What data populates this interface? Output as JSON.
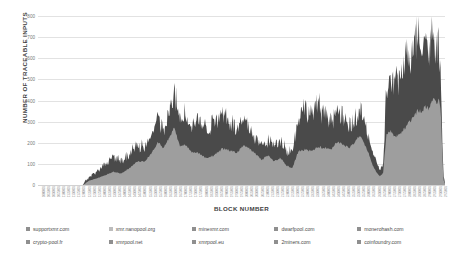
{
  "chart_data": {
    "type": "area",
    "stacked": true,
    "title": "",
    "xlabel": "BLOCK NUMBER",
    "ylabel": "NUMBER OF TRACEABLE INPUTS",
    "ylim": [
      0,
      800
    ],
    "yticks": [
      0,
      100,
      200,
      300,
      400,
      500,
      600,
      700,
      800
    ],
    "grid": true,
    "legend_position": "bottom",
    "legend_columns": 5,
    "x_tick_rotation": -90,
    "x": [
      1000001,
      1025001,
      1050001,
      1075001,
      1100001,
      1125001,
      1150001,
      1175001,
      1200001,
      1225001,
      1250001,
      1275001,
      1300001,
      1325001,
      1350001,
      1375001,
      1400001,
      1425001,
      1450001,
      1475001,
      1500001,
      1525001,
      1550001,
      1575001,
      1600001,
      1625001,
      1650001,
      1675001,
      1700001,
      1725001,
      1750001,
      1775001,
      1800001,
      1825001,
      1850001,
      1875001,
      1900001,
      1925001,
      1950001,
      1975001,
      2000001,
      2025001,
      2050001,
      2075001,
      2100001,
      2125001,
      2150001,
      2175001,
      2200001,
      2225001,
      2250001,
      2275001,
      2300001,
      2325001,
      2350001,
      2375001,
      2400001,
      2425001,
      2450001,
      2475001,
      2500001,
      2525001,
      2550001,
      2575001,
      2600001,
      2625001,
      2650001,
      2675001,
      2700001,
      2725001,
      2750001,
      2775001,
      2800001,
      2825001,
      2850001,
      2875001,
      2900001,
      2925001,
      2950001,
      2975001
    ],
    "series": [
      {
        "name": "supportxmr.com",
        "color": "#9a9a9a"
      },
      {
        "name": "xmr.nanopool.org",
        "color": "#c9c9c9"
      },
      {
        "name": "minexmr.com",
        "color": "#8f8f8f"
      },
      {
        "name": "dwarfpool.com",
        "color": "#a5a5a5"
      },
      {
        "name": "monerohash.com",
        "color": "#7b7b7b"
      },
      {
        "name": "crypto-pool.fr",
        "color": "#b4b4b4"
      },
      {
        "name": "xmrpool.net",
        "color": "#8a8a8a"
      },
      {
        "name": "xmrpool.eu",
        "color": "#9f9f9f"
      },
      {
        "name": "2miners.com",
        "color": "#707070"
      },
      {
        "name": "coinfoundry.com",
        "color": "#5f5f5f"
      }
    ]
  },
  "legend": {
    "items": [
      {
        "label": "supportxmr.com",
        "color": "#8f8f8f"
      },
      {
        "label": "xmr.nanopool.org",
        "color": "#bdbdbd"
      },
      {
        "label": "minexmr.com",
        "color": "#8f8f8f"
      },
      {
        "label": "dwarfpool.com",
        "color": "#8f8f8f"
      },
      {
        "label": "monerohash.com",
        "color": "#8f8f8f"
      },
      {
        "label": "crypto-pool.fr",
        "color": "#8f8f8f"
      },
      {
        "label": "xmrpool.net",
        "color": "#8f8f8f"
      },
      {
        "label": "xmrpool.eu",
        "color": "#8f8f8f"
      },
      {
        "label": "2miners.com",
        "color": "#8f8f8f"
      },
      {
        "label": "coinfoundry.com",
        "color": "#8f8f8f"
      }
    ]
  },
  "colors": {
    "band_lower": "#9e9e9e",
    "band_upper": "#4a4a4a",
    "gridline": "#e2e2e2",
    "background": "#ffffff"
  }
}
